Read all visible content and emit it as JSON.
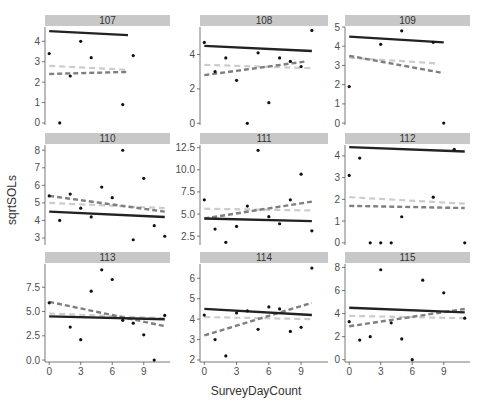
{
  "chart_data": {
    "type": "scatter",
    "layout": "facet_wrap 3x3",
    "xlabel": "SurveyDayCount",
    "ylabel": "sqrtSOLs",
    "x_ticks": [
      0,
      3,
      6,
      9
    ],
    "line_styles": {
      "solid_black": "#222222",
      "dashed_dark_gray": "#7f7f7f",
      "dashed_light_gray": "#cccccc"
    },
    "panels": [
      {
        "id": "107",
        "ylim": [
          -0.1,
          4.7
        ],
        "yticks": [
          0,
          1,
          2,
          3,
          4
        ],
        "ytick_labels": [
          "0",
          "1",
          "2",
          "3",
          "4"
        ],
        "points": [
          [
            0,
            3.4
          ],
          [
            1,
            0.0
          ],
          [
            2,
            2.3
          ],
          [
            3,
            4.0
          ],
          [
            4,
            3.2
          ],
          [
            7,
            0.9
          ],
          [
            8,
            3.3
          ]
        ],
        "lines": {
          "solid": [
            [
              0,
              4.5
            ],
            [
              7.5,
              4.3
            ]
          ],
          "dark_dashed": [
            [
              0,
              2.4
            ],
            [
              7.5,
              2.5
            ]
          ],
          "light_dashed": [
            [
              0,
              2.8
            ],
            [
              7.5,
              2.6
            ]
          ]
        }
      },
      {
        "id": "108",
        "ylim": [
          -0.1,
          5.6
        ],
        "yticks": [
          0,
          2,
          4
        ],
        "ytick_labels": [
          "0",
          "2",
          "4"
        ],
        "points": [
          [
            0,
            4.7
          ],
          [
            1,
            3.0
          ],
          [
            2,
            3.8
          ],
          [
            3,
            2.5
          ],
          [
            4,
            0.0
          ],
          [
            5,
            4.1
          ],
          [
            6,
            1.2
          ],
          [
            7,
            3.8
          ],
          [
            8,
            3.6
          ],
          [
            9,
            3.3
          ],
          [
            10,
            5.4
          ]
        ],
        "lines": {
          "solid": [
            [
              0,
              4.5
            ],
            [
              10,
              4.2
            ]
          ],
          "dark_dashed": [
            [
              0,
              2.8
            ],
            [
              9.5,
              3.6
            ]
          ],
          "light_dashed": [
            [
              0,
              3.4
            ],
            [
              10,
              3.2
            ]
          ]
        }
      },
      {
        "id": "109",
        "ylim": [
          -0.1,
          5.0
        ],
        "yticks": [
          0,
          1,
          2,
          3,
          4,
          5
        ],
        "ytick_labels": [
          "0",
          "1",
          "2",
          "3",
          "4",
          "5"
        ],
        "points": [
          [
            0,
            1.9
          ],
          [
            3,
            4.1
          ],
          [
            5,
            4.8
          ],
          [
            8,
            4.2
          ],
          [
            9,
            0.0
          ]
        ],
        "lines": {
          "solid": [
            [
              0,
              4.5
            ],
            [
              9,
              4.2
            ]
          ],
          "dark_dashed": [
            [
              0,
              3.5
            ],
            [
              9,
              2.6
            ]
          ],
          "light_dashed": [
            [
              0,
              3.4
            ],
            [
              8.5,
              3.1
            ]
          ]
        }
      },
      {
        "id": "110",
        "ylim": [
          2.6,
          8.3
        ],
        "yticks": [
          3,
          4,
          5,
          6,
          7,
          8
        ],
        "ytick_labels": [
          "3",
          "4",
          "5",
          "6",
          "7",
          "8"
        ],
        "points": [
          [
            0,
            5.4
          ],
          [
            1,
            4.0
          ],
          [
            2,
            5.5
          ],
          [
            3,
            4.7
          ],
          [
            4,
            4.2
          ],
          [
            5,
            5.9
          ],
          [
            6,
            5.3
          ],
          [
            7,
            8.0
          ],
          [
            8,
            2.9
          ],
          [
            9,
            6.4
          ],
          [
            10,
            3.7
          ],
          [
            11,
            3.1
          ]
        ],
        "lines": {
          "solid": [
            [
              0,
              4.5
            ],
            [
              11,
              4.2
            ]
          ],
          "dark_dashed": [
            [
              0,
              5.4
            ],
            [
              11,
              4.5
            ]
          ],
          "light_dashed": [
            [
              0,
              5.0
            ],
            [
              11,
              4.7
            ]
          ]
        }
      },
      {
        "id": "111",
        "ylim": [
          1.5,
          12.8
        ],
        "yticks": [
          2.5,
          5.0,
          7.5,
          10.0,
          12.5
        ],
        "ytick_labels": [
          "2.5",
          "5.0",
          "7.5",
          "10.0",
          "12.5"
        ],
        "points": [
          [
            0,
            6.6
          ],
          [
            1,
            3.3
          ],
          [
            2,
            1.8
          ],
          [
            3,
            3.6
          ],
          [
            4,
            5.9
          ],
          [
            5,
            12.2
          ],
          [
            6,
            4.7
          ],
          [
            7,
            3.9
          ],
          [
            8,
            6.6
          ],
          [
            9,
            9.5
          ],
          [
            10,
            3.1
          ]
        ],
        "lines": {
          "solid": [
            [
              0,
              4.5
            ],
            [
              10,
              4.2
            ]
          ],
          "dark_dashed": [
            [
              0,
              4.5
            ],
            [
              10,
              6.4
            ]
          ],
          "light_dashed": [
            [
              0,
              5.6
            ],
            [
              10,
              5.4
            ]
          ]
        }
      },
      {
        "id": "112",
        "ylim": [
          -0.1,
          4.5
        ],
        "yticks": [
          0,
          1,
          2,
          3,
          4
        ],
        "ytick_labels": [
          "0",
          "1",
          "2",
          "3",
          "4"
        ],
        "points": [
          [
            0,
            3.1
          ],
          [
            1,
            3.9
          ],
          [
            2,
            0.0
          ],
          [
            3,
            0.0
          ],
          [
            4,
            0.0
          ],
          [
            5,
            1.2
          ],
          [
            8,
            2.1
          ],
          [
            10,
            4.3
          ],
          [
            11,
            0.0
          ]
        ],
        "lines": {
          "solid": [
            [
              0,
              4.4
            ],
            [
              11,
              4.2
            ]
          ],
          "dark_dashed": [
            [
              0,
              1.7
            ],
            [
              11,
              1.6
            ]
          ],
          "light_dashed": [
            [
              0,
              2.1
            ],
            [
              11,
              1.8
            ]
          ]
        }
      },
      {
        "id": "113",
        "ylim": [
          -0.2,
          9.9
        ],
        "yticks": [
          0.0,
          2.5,
          5.0,
          7.5
        ],
        "ytick_labels": [
          "0.0",
          "2.5",
          "5.0",
          "7.5"
        ],
        "points": [
          [
            0,
            5.9
          ],
          [
            2,
            3.4
          ],
          [
            3,
            2.1
          ],
          [
            4,
            7.1
          ],
          [
            5,
            9.3
          ],
          [
            6,
            8.3
          ],
          [
            7,
            4.1
          ],
          [
            8,
            3.8
          ],
          [
            9,
            2.6
          ],
          [
            10,
            0.0
          ],
          [
            11,
            4.6
          ]
        ],
        "lines": {
          "solid": [
            [
              0,
              4.5
            ],
            [
              11,
              4.2
            ]
          ],
          "dark_dashed": [
            [
              0,
              6.0
            ],
            [
              11,
              3.5
            ]
          ],
          "light_dashed": [
            [
              0,
              4.8
            ],
            [
              11,
              4.3
            ]
          ]
        }
      },
      {
        "id": "114",
        "ylim": [
          1.9,
          6.7
        ],
        "yticks": [
          2,
          3,
          4,
          5,
          6
        ],
        "ytick_labels": [
          "2",
          "3",
          "4",
          "5",
          "6"
        ],
        "points": [
          [
            0,
            4.2
          ],
          [
            1,
            3.0
          ],
          [
            2,
            2.2
          ],
          [
            3,
            4.3
          ],
          [
            4,
            4.4
          ],
          [
            5,
            3.5
          ],
          [
            6,
            4.6
          ],
          [
            7,
            4.5
          ],
          [
            8,
            3.4
          ],
          [
            9,
            3.6
          ],
          [
            10,
            6.5
          ]
        ],
        "lines": {
          "solid": [
            [
              0,
              4.5
            ],
            [
              10,
              4.2
            ]
          ],
          "dark_dashed": [
            [
              0,
              3.2
            ],
            [
              10,
              4.8
            ]
          ],
          "light_dashed": [
            [
              0,
              4.1
            ],
            [
              10,
              4.0
            ]
          ]
        }
      },
      {
        "id": "115",
        "ylim": [
          -0.2,
          8.3
        ],
        "yticks": [
          0,
          2,
          4,
          6,
          8
        ],
        "ytick_labels": [
          "0",
          "2",
          "4",
          "6",
          "8"
        ],
        "points": [
          [
            0,
            3.3
          ],
          [
            1,
            1.7
          ],
          [
            2,
            2.0
          ],
          [
            3,
            7.8
          ],
          [
            4,
            3.2
          ],
          [
            5,
            1.8
          ],
          [
            6,
            0.0
          ],
          [
            7,
            6.9
          ],
          [
            9,
            5.8
          ],
          [
            11,
            3.6
          ]
        ],
        "lines": {
          "solid": [
            [
              0,
              4.5
            ],
            [
              11,
              4.1
            ]
          ],
          "dark_dashed": [
            [
              0,
              2.9
            ],
            [
              11,
              4.4
            ]
          ],
          "light_dashed": [
            [
              0,
              3.8
            ],
            [
              11,
              3.6
            ]
          ]
        }
      }
    ]
  },
  "layout": {
    "cols_x": [
      [
        45,
        170
      ],
      [
        200,
        328
      ],
      [
        345,
        470
      ]
    ],
    "rows_y": [
      [
        15,
        27,
        125
      ],
      [
        133,
        145,
        245
      ],
      [
        252,
        264,
        362
      ]
    ],
    "xdomain": [
      -0.4,
      11.5
    ]
  }
}
